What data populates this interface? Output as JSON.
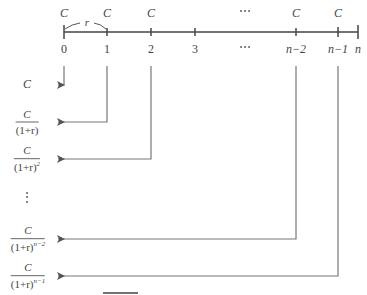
{
  "diagram": {
    "title": "",
    "timeline": {
      "rate_label": "r",
      "cashflow_label": "C",
      "ticks": [
        {
          "label": "0",
          "x": 64,
          "cash": "C",
          "italic": false
        },
        {
          "label": "1",
          "x": 107,
          "cash": "C",
          "italic": false
        },
        {
          "label": "2",
          "x": 151,
          "cash": "C",
          "italic": false
        },
        {
          "label": "3",
          "x": 195,
          "cash": "",
          "italic": false
        },
        {
          "label": "⋯",
          "x": 245,
          "cash": "⋯",
          "italic": false,
          "no_tick": true
        },
        {
          "label": "n−2",
          "x": 296,
          "cash": "C",
          "italic": true
        },
        {
          "label": "n−1",
          "x": 338,
          "cash": "C",
          "italic": true
        },
        {
          "label": "n",
          "x": 358,
          "cash": "",
          "italic": true
        }
      ]
    },
    "present_values": [
      {
        "numerator": "C",
        "denominator": "",
        "exponent": "",
        "from_tick": "0",
        "y": 85
      },
      {
        "numerator": "C",
        "denominator": "(1+r)",
        "exponent": "",
        "from_tick": "1",
        "y": 122
      },
      {
        "numerator": "C",
        "denominator": "(1+r)",
        "exponent": "2",
        "from_tick": "2",
        "y": 159
      },
      {
        "numerator": "⋮",
        "denominator": "",
        "exponent": "",
        "from_tick": "",
        "y": 200
      },
      {
        "numerator": "C",
        "denominator": "(1+r)",
        "exponent": "n−2",
        "from_tick": "n−2",
        "y": 239
      },
      {
        "numerator": "C",
        "denominator": "(1+r)",
        "exponent": "n−1",
        "from_tick": "n−1",
        "y": 276
      }
    ],
    "colors": {
      "line": "#444444",
      "arrow": "#666666",
      "text": "#555555"
    }
  }
}
